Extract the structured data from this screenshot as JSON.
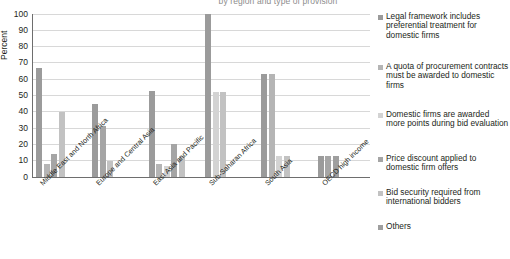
{
  "chart_data": {
    "type": "bar",
    "title": "by region and type of provision",
    "xlabel": "",
    "ylabel": "Percent",
    "ylim": [
      0,
      100
    ],
    "yticks": [
      0,
      10,
      20,
      30,
      40,
      50,
      60,
      70,
      80,
      90,
      100
    ],
    "ytick_labels": [
      "0",
      "10",
      "20",
      "30",
      "40",
      "50",
      "60",
      "70",
      "80",
      "90",
      "100"
    ],
    "grid": true,
    "legend_position": "right",
    "categories": [
      "Middle East and North Africa",
      "Europe and Central Asia",
      "East Asia and Pacific",
      "Sub-Saharan Africa",
      "South Asia",
      "OECD high income"
    ],
    "series": [
      {
        "name": "Legal framework includes preferential treatment for domestic firms",
        "color": "#9b9b9b",
        "values": [
          67,
          45,
          53,
          100,
          63,
          13
        ]
      },
      {
        "name": "A quota  of procurement contracts must be awarded to domestic firms",
        "color": "#b5b5b5",
        "values": [
          8,
          0,
          8,
          0,
          63,
          0
        ]
      },
      {
        "name": "Domestic firms are awarded more points during bid evaluation",
        "color": "#d3d3d3",
        "values": [
          0,
          0,
          7,
          52,
          13,
          0
        ]
      },
      {
        "name": "Price discount applied to domestic firm offers",
        "color": "#a5a5a5",
        "values": [
          14,
          31,
          20,
          0,
          0,
          13
        ]
      },
      {
        "name": "Bid security required from international bidders",
        "color": "#c2c2c2",
        "values": [
          40,
          10,
          13,
          52,
          13,
          0
        ]
      },
      {
        "name": "Others",
        "color": "#9f9f9f",
        "values": [
          0,
          0,
          0,
          0,
          0,
          13
        ]
      }
    ]
  },
  "legend": {
    "items": [
      {
        "label": "Legal framework includes preferential treatment for domestic firms",
        "color": "#9b9b9b"
      },
      {
        "label": "A quota  of procurement contracts must be awarded to domestic firms",
        "color": "#b5b5b5"
      },
      {
        "label": "Domestic firms are awarded more points during bid evaluation",
        "color": "#d3d3d3"
      },
      {
        "label": "Price discount applied to domestic firm offers",
        "color": "#a5a5a5"
      },
      {
        "label": "Bid security required from international bidders",
        "color": "#c2c2c2"
      },
      {
        "label": "Others",
        "color": "#9f9f9f"
      }
    ]
  },
  "axis": {
    "y_title": "Percent"
  },
  "colors": {
    "gridline": "#d8d8d8",
    "axis": "#6e6e6e",
    "text": "#231f20",
    "title": "#8d8d8d",
    "background": "#ffffff"
  }
}
